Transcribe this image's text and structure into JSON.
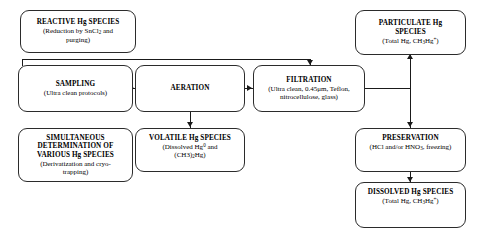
{
  "diagram": {
    "type": "flowchart",
    "orientation": "left-to-right",
    "background_color": "#ffffff",
    "line_color": "#1a1a1a",
    "box_border_color": "#2b2b2b",
    "box_fill_color": "#ffffff"
  },
  "nodes": {
    "reactive": {
      "title": "REACTIVE Hg SPECIES",
      "sub_prefix": "(Reduction by SnCl",
      "sub_sub": "2",
      "sub_suffix": " and\npurging)"
    },
    "particulate": {
      "title": "PARTICULATE Hg\nSPECIES",
      "sub_prefix": "(Total Hg, CH",
      "sub_sub": "3",
      "sub_mid": "Hg",
      "sub_sup": "+",
      "sub_suffix": ")"
    },
    "sampling": {
      "title": "SAMPLING",
      "sub": "(Ultra clean protocols)"
    },
    "aeration": {
      "title": "AERATION",
      "sub": ""
    },
    "filtration": {
      "title": "FILTRATION",
      "sub_prefix": "(Ultra clean, 0.45",
      "sub_mu": "μm",
      "sub_suffix": ", Teflon,\nnitrocellulose, glass)"
    },
    "simultaneous": {
      "title": "SIMULTANEOUS\nDETERMINATION OF\nVARIOUS Hg SPECIES",
      "sub": "(Derivatization and cryo-\ntrapping)"
    },
    "volatile": {
      "title": "VOLATILE Hg SPECIES",
      "sub_prefix": "(Dissolved Hg",
      "sub_sup": "0",
      "sub_mid": " and\n(CH3)",
      "sub_sub": "2",
      "sub_suffix": "Hg)"
    },
    "preservation": {
      "title": "PRESERVATION",
      "sub_prefix": "(HCl and/or HNO",
      "sub_sub": "3",
      "sub_suffix": ", freezing)"
    },
    "dissolved": {
      "title": "DISSOLVED Hg SPECIES",
      "sub_prefix": "(Total Hg, CH",
      "sub_sub": "3",
      "sub_mid": "Hg",
      "sub_sup": "+",
      "sub_suffix": ")"
    }
  },
  "edges": [
    {
      "from": "sampling",
      "to": "aeration",
      "direction": "right"
    },
    {
      "from": "aeration",
      "to": "filtration",
      "direction": "right"
    },
    {
      "from": "sampling",
      "to": "filtration",
      "direction": "down",
      "routing": "top-bracket"
    },
    {
      "from": "aeration",
      "to": "volatile",
      "direction": "down"
    },
    {
      "from": "filtration",
      "to": "particulate",
      "direction": "up",
      "routing": "right-riser"
    },
    {
      "from": "filtration",
      "to": "preservation",
      "direction": "down",
      "routing": "right-riser"
    },
    {
      "from": "preservation",
      "to": "dissolved",
      "direction": "down"
    }
  ]
}
